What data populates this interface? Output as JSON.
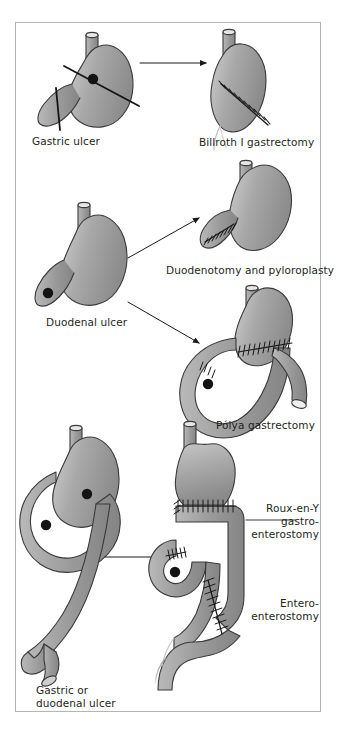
{
  "figure": {
    "frame": {
      "border_color": "#b4b4b4",
      "background": "#ffffff"
    },
    "palette": {
      "organ_fill_light": "#c9c9c9",
      "organ_fill_mid": "#9d9d9d",
      "organ_fill_dark": "#7e7e7e",
      "outline": "#3a3a3a",
      "ulcer": "#141414",
      "suture": "#1a1a1a",
      "arrow": "#1a1a1a",
      "text": "#231f20"
    },
    "rows": [
      {
        "id": "row-gastric",
        "before": {
          "label": "Gastric ulcer",
          "markers": [
            "ulcer-dot",
            "resection-line-upper",
            "resection-line-lower"
          ]
        },
        "arrows": [
          {
            "from": "gastric-ulcer",
            "to": "billroth-i"
          }
        ],
        "after": [
          {
            "label": "Billroth I gastrectomy",
            "markers": [
              "suture-line"
            ]
          }
        ]
      },
      {
        "id": "row-duodenal",
        "before": {
          "label": "Duodenal ulcer",
          "markers": [
            "ulcer-dot"
          ]
        },
        "arrows": [
          {
            "from": "duodenal-ulcer",
            "to": "duodenotomy-pyloroplasty"
          },
          {
            "from": "duodenal-ulcer",
            "to": "polya-gastrectomy"
          }
        ],
        "after": [
          {
            "label": "Duodenotomy and pyloroplasty",
            "markers": [
              "suture-line"
            ]
          },
          {
            "label": "Pólya gastrectomy",
            "markers": [
              "suture-line",
              "ulcer-dot",
              "duodenal-stump"
            ]
          }
        ]
      },
      {
        "id": "row-roux",
        "before": {
          "label": "Gastric or\nduodenal ulcer",
          "label_lines": [
            "Gastric or",
            "duodenal ulcer"
          ],
          "markers": [
            "ulcer-dot-gastric",
            "ulcer-dot-duodenal"
          ]
        },
        "arrows": [
          {
            "from": "gastric-or-duodenal-ulcer",
            "to": "roux-en-y"
          }
        ],
        "after": [
          {
            "label": "Roux-en-Y\ngastro-\nenterostomy",
            "label_lines": [
              "Roux-en-Y",
              "gastro-",
              "enterostomy"
            ],
            "markers": [
              "suture-line",
              "leader-line"
            ]
          },
          {
            "label": "Entero-\nenterostomy",
            "label_lines": [
              "Entero-",
              "enterostomy"
            ],
            "markers": [
              "suture-line"
            ]
          }
        ]
      }
    ],
    "captions": {
      "gastric_ulcer": "Gastric ulcer",
      "billroth_i": "Billroth I gastrectomy",
      "duodenal_ulcer": "Duodenal ulcer",
      "duodenotomy": "Duodenotomy and pyloroplasty",
      "polya": "Pólya gastrectomy",
      "roux_line1": "Roux-en-Y",
      "roux_line2": "gastro-",
      "roux_line3": "enterostomy",
      "entero_line1": "Entero-",
      "entero_line2": "enterostomy",
      "bottom_line1": "Gastric or",
      "bottom_line2": "duodenal ulcer"
    }
  }
}
